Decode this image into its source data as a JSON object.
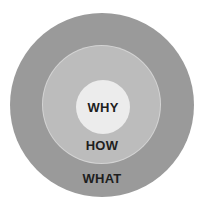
{
  "diagram": {
    "type": "concentric-circles",
    "rings": [
      {
        "label": "WHY",
        "color": "#ececec",
        "position": "inner"
      },
      {
        "label": "HOW",
        "color": "#bcbcbc",
        "position": "middle"
      },
      {
        "label": "WHAT",
        "color": "#9a9a9a",
        "position": "outer"
      }
    ]
  }
}
